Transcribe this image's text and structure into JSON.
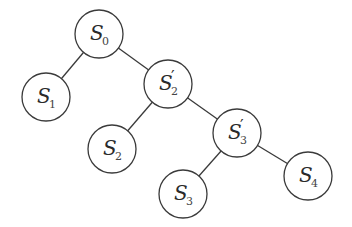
{
  "diagram": {
    "type": "binary-tree",
    "nodes": [
      {
        "id": "S0",
        "base": "S",
        "prime": "",
        "sub": "0",
        "cx": 99,
        "cy": 34
      },
      {
        "id": "S1",
        "base": "S",
        "prime": "",
        "sub": "1",
        "cx": 46,
        "cy": 97
      },
      {
        "id": "S2p",
        "base": "S",
        "prime": "′",
        "sub": "2",
        "cx": 168,
        "cy": 84
      },
      {
        "id": "S2",
        "base": "S",
        "prime": "",
        "sub": "2",
        "cx": 112,
        "cy": 149
      },
      {
        "id": "S3p",
        "base": "S",
        "prime": "′",
        "sub": "3",
        "cx": 237,
        "cy": 133
      },
      {
        "id": "S3",
        "base": "S",
        "prime": "",
        "sub": "3",
        "cx": 183,
        "cy": 194
      },
      {
        "id": "S4",
        "base": "S",
        "prime": "",
        "sub": "4",
        "cx": 308,
        "cy": 176
      }
    ],
    "edges": [
      {
        "from": "S0",
        "to": "S1"
      },
      {
        "from": "S0",
        "to": "S2p"
      },
      {
        "from": "S2p",
        "to": "S2"
      },
      {
        "from": "S2p",
        "to": "S3p"
      },
      {
        "from": "S3p",
        "to": "S3"
      },
      {
        "from": "S3p",
        "to": "S4"
      }
    ],
    "node_radius": 24,
    "colors": {
      "stroke": "#3a3a3a",
      "fill": "#ffffff",
      "text": "#2a2a2a"
    }
  }
}
